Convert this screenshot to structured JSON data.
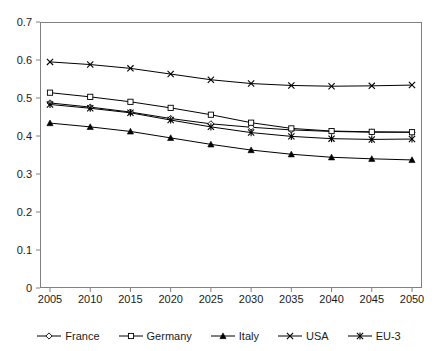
{
  "chart_data": {
    "type": "line",
    "title": "",
    "xlabel": "",
    "ylabel": "",
    "categories": [
      2005,
      2010,
      2015,
      2020,
      2025,
      2030,
      2035,
      2040,
      2045,
      2050
    ],
    "x_tick_labels": [
      "2005",
      "2010",
      "2015",
      "2020",
      "2025",
      "2030",
      "2035",
      "2040",
      "2045",
      "2050"
    ],
    "y_tick_labels": [
      "0",
      "0.1",
      "0.2",
      "0.3",
      "0.4",
      "0.5",
      "0.6",
      "0.7"
    ],
    "y_tick_values": [
      0,
      0.1,
      0.2,
      0.3,
      0.4,
      0.5,
      0.6,
      0.7
    ],
    "ylim": [
      0,
      0.7
    ],
    "xlim": [
      2002.5,
      2052.5
    ],
    "grid": false,
    "legend_position": "bottom",
    "series": [
      {
        "name": "France",
        "marker": "open-diamond",
        "values": [
          0.487,
          0.476,
          0.463,
          0.446,
          0.432,
          0.423,
          0.416,
          0.412,
          0.41,
          0.41
        ]
      },
      {
        "name": "Germany",
        "marker": "open-square",
        "values": [
          0.514,
          0.503,
          0.49,
          0.474,
          0.456,
          0.435,
          0.42,
          0.413,
          0.411,
          0.41
        ]
      },
      {
        "name": "Italy",
        "marker": "filled-triangle",
        "values": [
          0.434,
          0.424,
          0.412,
          0.395,
          0.378,
          0.363,
          0.352,
          0.344,
          0.34,
          0.337
        ]
      },
      {
        "name": "USA",
        "marker": "cross-x",
        "values": [
          0.595,
          0.588,
          0.578,
          0.563,
          0.548,
          0.538,
          0.533,
          0.531,
          0.532,
          0.534
        ]
      },
      {
        "name": "EU-3",
        "marker": "star-asterisk",
        "values": [
          0.483,
          0.473,
          0.461,
          0.442,
          0.424,
          0.409,
          0.399,
          0.393,
          0.391,
          0.392
        ]
      }
    ]
  },
  "legend": {
    "items": [
      {
        "label": "France",
        "marker": "open-diamond"
      },
      {
        "label": "Germany",
        "marker": "open-square"
      },
      {
        "label": "Italy",
        "marker": "filled-triangle"
      },
      {
        "label": "USA",
        "marker": "cross-x"
      },
      {
        "label": "EU-3",
        "marker": "star-asterisk"
      }
    ]
  },
  "colors": {
    "line": "#000000",
    "axis": "#808080",
    "text": "#1a1a1a",
    "background": "#ffffff"
  }
}
